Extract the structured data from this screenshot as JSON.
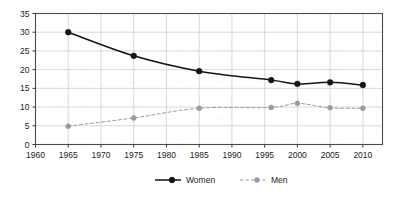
{
  "chart_data": {
    "type": "line",
    "title": "",
    "subtitle": "",
    "xlabel": "",
    "ylabel": "",
    "xlim": [
      1960,
      2013
    ],
    "ylim": [
      0,
      35
    ],
    "grid": true,
    "legend_position": "bottom",
    "x_ticks": [
      1960,
      1965,
      1970,
      1975,
      1980,
      1985,
      1990,
      1995,
      2000,
      2005,
      2010
    ],
    "x_tick_labels": [
      "1960",
      "1965",
      "1970",
      "1975",
      "1980",
      "1985",
      "1990",
      "1995",
      "2000",
      "2005",
      "2010"
    ],
    "y_ticks": [
      0,
      5,
      10,
      15,
      20,
      25,
      30,
      35
    ],
    "y_tick_labels": [
      "0",
      "5",
      "10",
      "15",
      "20",
      "25",
      "30",
      "35"
    ],
    "series": [
      {
        "name": "Women",
        "color": "#141414",
        "line_style": "solid",
        "marker": "filled-circle",
        "x": [
          1965,
          1975,
          1985,
          1996,
          2000,
          2005,
          2010
        ],
        "values": [
          30.0,
          23.7,
          19.6,
          17.2,
          16.2,
          16.6,
          15.9
        ]
      },
      {
        "name": "Men",
        "color": "#9a9a9a",
        "line_style": "dashed",
        "marker": "filled-circle",
        "x": [
          1965,
          1975,
          1985,
          1996,
          2000,
          2005,
          2010
        ],
        "values": [
          4.9,
          7.1,
          9.7,
          9.9,
          11.0,
          9.8,
          9.7
        ]
      }
    ]
  },
  "legend": {
    "items": [
      {
        "label": "Women"
      },
      {
        "label": "Men"
      }
    ]
  }
}
